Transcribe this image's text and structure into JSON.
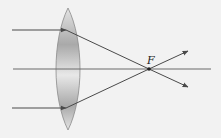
{
  "diagram": {
    "focal_label": "F",
    "colors": {
      "background": "#f2f2f2",
      "ray": "#4a4a4a",
      "axis": "#6a6a6a",
      "lens_edge": "#8a8a8a",
      "lens_light": "#e6e6e6",
      "lens_dark": "#a8a8a8"
    },
    "elements": [
      {
        "type": "lens",
        "kind": "convex"
      },
      {
        "type": "ray",
        "name": "top-ray",
        "incoming_y": 30
      },
      {
        "type": "optical-axis",
        "y": 69
      },
      {
        "type": "ray",
        "name": "bottom-ray",
        "incoming_y": 108
      },
      {
        "type": "focal-point",
        "label": "F"
      }
    ]
  }
}
